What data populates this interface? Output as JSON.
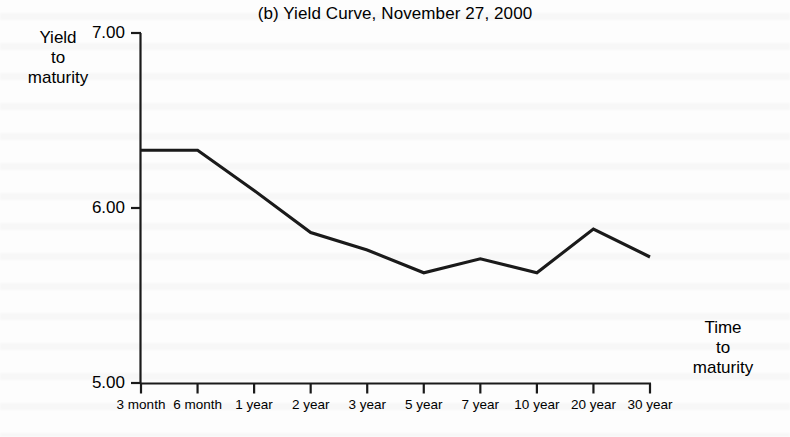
{
  "chart_data": {
    "type": "line",
    "title": "(b) Yield Curve, November 27, 2000",
    "xlabel": "Time to maturity",
    "ylabel": "Yield to maturity",
    "categories": [
      "3 month",
      "6 month",
      "1 year",
      "2 year",
      "3 year",
      "5 year",
      "7 year",
      "10 year",
      "20 year",
      "30 year"
    ],
    "values": [
      6.33,
      6.33,
      6.1,
      5.86,
      5.76,
      5.63,
      5.71,
      5.63,
      5.88,
      5.72
    ],
    "series": [
      {
        "name": "U.S. Treasury yield curve",
        "values": [
          6.33,
          6.33,
          6.1,
          5.86,
          5.76,
          5.63,
          5.71,
          5.63,
          5.88,
          5.72
        ]
      }
    ],
    "ylim": [
      5.0,
      7.0
    ],
    "ytick_values": [
      5.0,
      6.0,
      7.0
    ],
    "ytick_labels": [
      "5.00",
      "6.00",
      "7.00"
    ],
    "grid": false,
    "legend": "none",
    "line_color": "#1a1a1a",
    "background_color": "#fdfdfd"
  },
  "axis": {
    "y_label_lines": [
      "Yield",
      "to",
      "maturity"
    ],
    "x_label_lines": [
      "Time",
      "to",
      "maturity"
    ]
  }
}
